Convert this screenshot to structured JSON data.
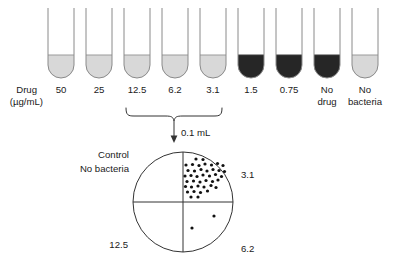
{
  "figure": {
    "title_visible": false,
    "axis_label_line1": "Drug",
    "axis_label_line2": "(µg/mL)",
    "transfer_label": "0.1 mL"
  },
  "tubes": [
    {
      "label": "50",
      "label_line2": "",
      "turbid": false,
      "cx": 61,
      "fill": "#d8d8d8"
    },
    {
      "label": "25",
      "label_line2": "",
      "turbid": false,
      "cx": 99,
      "fill": "#d8d8d8"
    },
    {
      "label": "12.5",
      "label_line2": "",
      "turbid": false,
      "cx": 137,
      "fill": "#d8d8d8"
    },
    {
      "label": "6.2",
      "label_line2": "",
      "turbid": false,
      "cx": 175,
      "fill": "#d8d8d8"
    },
    {
      "label": "3.1",
      "label_line2": "",
      "turbid": false,
      "cx": 213,
      "fill": "#d8d8d8"
    },
    {
      "label": "1.5",
      "label_line2": "",
      "turbid": true,
      "cx": 251,
      "fill": "#262626"
    },
    {
      "label": "0.75",
      "label_line2": "",
      "turbid": true,
      "cx": 289,
      "fill": "#262626"
    },
    {
      "label": "No",
      "label_line2": "drug",
      "turbid": true,
      "cx": 327,
      "fill": "#262626"
    },
    {
      "label": "No",
      "label_line2": "bacteria",
      "turbid": false,
      "cx": 365,
      "fill": "#d8d8d8"
    }
  ],
  "brace": {
    "from_tube_label": "12.5",
    "to_tube_label": "3.1"
  },
  "plate": {
    "center_x": 183,
    "center_y": 202,
    "radius": 50,
    "quadrants": [
      {
        "position": "upper-left",
        "label_line1": "Control",
        "label_line2": "No bacteria",
        "colony_count": 0
      },
      {
        "position": "upper-right",
        "label_line1": "3.1",
        "label_line2": "",
        "colony_count": 41
      },
      {
        "position": "lower-left",
        "label_line1": "12.5",
        "label_line2": "",
        "colony_count": 0
      },
      {
        "position": "lower-right",
        "label_line1": "6.2",
        "label_line2": "",
        "colony_count": 2
      }
    ]
  },
  "chart_data": {
    "type": "table",
    "xlabel": "Drug (µg/mL)",
    "ylabel": "Turbidity (bacterial growth)",
    "categories": [
      "50",
      "25",
      "12.5",
      "6.2",
      "3.1",
      "1.5",
      "0.75",
      "No drug",
      "No bacteria"
    ],
    "series": [
      {
        "name": "Tube turbidity (0 = clear / no growth, 1 = turbid / growth)",
        "values": [
          0,
          0,
          0,
          0,
          0,
          1,
          1,
          1,
          0
        ]
      },
      {
        "name": "Subculture colony count on plate quadrant",
        "values": [
          null,
          null,
          0,
          2,
          41,
          null,
          null,
          null,
          null
        ]
      }
    ],
    "annotations": [
      "0.1 mL subcultured from the clear tubes 12.5, 6.2 and 3.1 µg/mL",
      "Upper-left quadrant = Control, No bacteria",
      "MBC read from quadrant with no growth"
    ],
    "grid": false,
    "legend": "none"
  },
  "colonies_upper_right": [
    [
      0.16,
      0.1
    ],
    [
      0.3,
      0.1
    ],
    [
      0.09,
      0.2
    ],
    [
      0.22,
      0.21
    ],
    [
      0.35,
      0.19
    ],
    [
      0.49,
      0.22
    ],
    [
      0.05,
      0.31
    ],
    [
      0.17,
      0.3
    ],
    [
      0.3,
      0.32
    ],
    [
      0.42,
      0.3
    ],
    [
      0.56,
      0.33
    ],
    [
      0.66,
      0.29
    ],
    [
      0.08,
      0.41
    ],
    [
      0.21,
      0.42
    ],
    [
      0.34,
      0.4
    ],
    [
      0.46,
      0.43
    ],
    [
      0.59,
      0.41
    ],
    [
      0.7,
      0.44
    ],
    [
      0.04,
      0.52
    ],
    [
      0.16,
      0.53
    ],
    [
      0.28,
      0.51
    ],
    [
      0.4,
      0.54
    ],
    [
      0.53,
      0.52
    ],
    [
      0.65,
      0.55
    ],
    [
      0.77,
      0.51
    ],
    [
      0.1,
      0.63
    ],
    [
      0.23,
      0.62
    ],
    [
      0.36,
      0.65
    ],
    [
      0.48,
      0.62
    ],
    [
      0.6,
      0.65
    ],
    [
      0.72,
      0.63
    ],
    [
      0.83,
      0.61
    ],
    [
      0.06,
      0.74
    ],
    [
      0.19,
      0.75
    ],
    [
      0.32,
      0.73
    ],
    [
      0.44,
      0.76
    ],
    [
      0.57,
      0.74
    ],
    [
      0.69,
      0.77
    ],
    [
      0.8,
      0.73
    ],
    [
      0.26,
      0.86
    ],
    [
      0.4,
      0.85
    ]
  ],
  "colonies_lower_right": [
    [
      0.62,
      0.28
    ],
    [
      0.18,
      0.52
    ]
  ]
}
